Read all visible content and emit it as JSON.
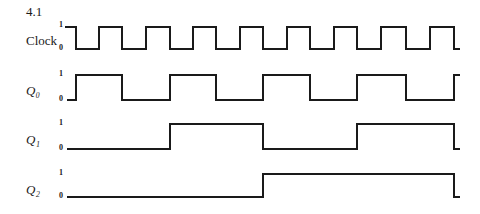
{
  "figure": {
    "number": "4.1"
  },
  "signals": [
    {
      "name": "Clock",
      "label": "Clock",
      "italic": false,
      "label_pos": [
        26,
        34
      ],
      "tick_one": "1",
      "tick_zero": "0",
      "y_high": 27,
      "y_low": 49,
      "x_start": 65,
      "x_end": 460,
      "initial": 1,
      "edges": [
        76,
        99,
        122,
        146,
        170,
        193,
        216,
        240,
        263,
        287,
        310,
        334,
        357,
        381,
        406,
        430,
        454
      ]
    },
    {
      "name": "Q0",
      "label": "Q₀",
      "italic": true,
      "label_pos": [
        26,
        85
      ],
      "tick_one": "1",
      "tick_zero": "0",
      "y_high": 75,
      "y_low": 100,
      "x_start": 67,
      "x_end": 460,
      "initial": 0,
      "edges": [
        76,
        122,
        170,
        216,
        263,
        310,
        357,
        406,
        454
      ]
    },
    {
      "name": "Q1",
      "label": "Q₁",
      "italic": true,
      "label_pos": [
        26,
        134
      ],
      "tick_one": "1",
      "tick_zero": "0",
      "y_high": 124,
      "y_low": 149,
      "x_start": 67,
      "x_end": 460,
      "initial": 0,
      "edges": [
        170,
        263,
        357,
        454
      ]
    },
    {
      "name": "Q2",
      "label": "Q₂",
      "italic": true,
      "label_pos": [
        26,
        184
      ],
      "tick_one": "1",
      "tick_zero": "0",
      "y_high": 174,
      "y_low": 197,
      "x_start": 67,
      "x_end": 460,
      "initial": 0,
      "edges": [
        263,
        454
      ]
    }
  ],
  "colors": {
    "line": "#1a1a1a",
    "background": "#ffffff"
  }
}
